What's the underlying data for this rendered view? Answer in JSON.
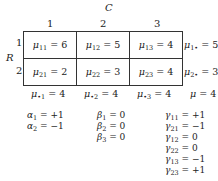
{
  "factor_col": "C",
  "factor_row": "R",
  "col_headers": [
    "1",
    "2",
    "3"
  ],
  "row_headers": [
    "1",
    "2"
  ],
  "cells": [
    [
      {
        "sym": "μ",
        "sub": "11",
        "val": "= 6"
      },
      {
        "sym": "μ",
        "sub": "12",
        "val": "= 5"
      },
      {
        "sym": "μ",
        "sub": "13",
        "val": "= 4"
      }
    ],
    [
      {
        "sym": "μ",
        "sub": "21",
        "val": "= 2"
      },
      {
        "sym": "μ",
        "sub": "22",
        "val": "= 3"
      },
      {
        "sym": "μ",
        "sub": "23",
        "val": "= 4"
      }
    ]
  ],
  "row_means": [
    {
      "sym": "μ",
      "sub": "1•",
      "val": "= 5"
    },
    {
      "sym": "μ",
      "sub": "2•",
      "val": "= 3"
    }
  ],
  "col_means": [
    {
      "sym": "μ",
      "sub": "•1",
      "val": "= 4"
    },
    {
      "sym": "μ",
      "sub": "•2",
      "val": "= 4"
    },
    {
      "sym": "μ",
      "sub": "•3",
      "val": "= 4"
    }
  ],
  "grand_mean": {
    "sym": "μ",
    "val": "= 4"
  },
  "alpha": [
    {
      "sym": "α",
      "sub": "1",
      "val": "= +1"
    },
    {
      "sym": "α",
      "sub": "2",
      "val": "= −1"
    }
  ],
  "beta": [
    {
      "sym": "β",
      "sub": "1",
      "val": "= 0"
    },
    {
      "sym": "β",
      "sub": "2",
      "val": "= 0"
    },
    {
      "sym": "β",
      "sub": "3",
      "val": "= 0"
    }
  ],
  "gamma": [
    {
      "sym": "γ",
      "sub": "11",
      "val": "= +1"
    },
    {
      "sym": "γ",
      "sub": "21",
      "val": "= −1"
    },
    {
      "sym": "γ",
      "sub": "12",
      "val": "= 0"
    },
    {
      "sym": "γ",
      "sub": "22",
      "val": "= 0"
    },
    {
      "sym": "γ",
      "sub": "13",
      "val": "= −1"
    },
    {
      "sym": "γ",
      "sub": "23",
      "val": "= +1"
    }
  ]
}
